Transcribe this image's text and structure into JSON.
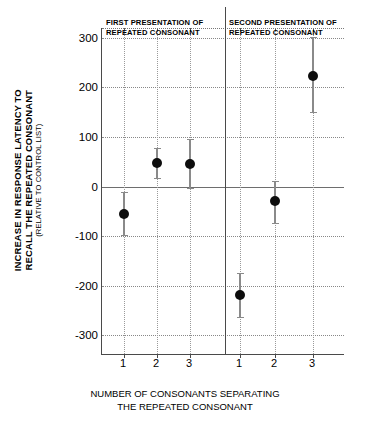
{
  "chart_data": {
    "type": "scatter",
    "title": "",
    "xlabel": "NUMBER OF CONSONANTS SEPARATING THE REPEATED CONSONANT",
    "xlabel_line1": "NUMBER OF CONSONANTS SEPARATING",
    "xlabel_line2": "THE REPEATED CONSONANT",
    "ylabel": "INCREASE IN RESPONSE LATENCY TO RECALL THE REPEATED CONSONANT",
    "ylabel_line1": "INCREASE IN RESPONSE LATENCY TO",
    "ylabel_line2": "RECALL THE REPEATED CONSONANT",
    "ylabel_sub": "(RELATIVE TO CONTROL LIST)",
    "ylim": [
      -340,
      320
    ],
    "yticks": [
      300,
      200,
      100,
      0,
      -100,
      -200,
      -300
    ],
    "ytick_labels": [
      "300",
      "200",
      "100",
      "0",
      "-100",
      "-200",
      "-300"
    ],
    "categories": [
      "1",
      "2",
      "3"
    ],
    "grid": true,
    "grid_style": "dotted",
    "zero_line": true,
    "legend": "none",
    "marker": "filled-circle",
    "marker_color": "#0d0d0d",
    "errorbar_color": "#8a8a8a",
    "panels": [
      {
        "caption": "FIRST PRESENTATION OF REPEATED CONSONANT",
        "caption_line1": "FIRST PRESENTATION OF",
        "caption_line2": "REPEATED CONSONANT",
        "x": [
          "1",
          "2",
          "3"
        ],
        "values": [
          -55,
          48,
          46
        ],
        "err_low": [
          -97,
          18,
          -3
        ],
        "err_high": [
          -12,
          78,
          96
        ]
      },
      {
        "caption": "SECOND PRESENTATION OF REPEATED CONSONANT",
        "caption_line1": "SECOND PRESENTATION OF",
        "caption_line2": "REPEATED CONSONANT",
        "x": [
          "1",
          "2",
          "3"
        ],
        "values": [
          -219,
          -30,
          224
        ],
        "err_low": [
          -264,
          -73,
          150
        ],
        "err_high": [
          -174,
          12,
          301
        ]
      }
    ]
  }
}
